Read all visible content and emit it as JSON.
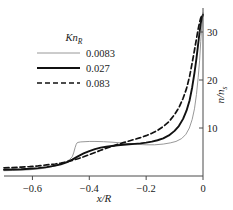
{
  "chart_data": {
    "type": "line",
    "title": "",
    "xlabel": "x/R",
    "ylabel": "n/n_s",
    "ylabel_main": "n/n",
    "ylabel_sub": "s",
    "xlabel_main": "x/R",
    "xlim": [
      -0.7,
      0.0
    ],
    "ylim": [
      0,
      35
    ],
    "xticks": [
      -0.6,
      -0.4,
      -0.2,
      0
    ],
    "xticklabels": [
      "−0.6",
      "−0.4",
      "−0.2",
      "0"
    ],
    "yticks": [
      10,
      20,
      30
    ],
    "yticklabels": [
      "10",
      "20",
      "30"
    ],
    "grid": false,
    "legend_position": "upper-left",
    "legend_title": "Kn",
    "legend_title_sub": "R",
    "series": [
      {
        "name": "0.0083",
        "style": "thin-solid",
        "color": "#8c8c8c",
        "width": 0.9,
        "x": [
          -0.7,
          -0.67,
          -0.64,
          -0.61,
          -0.58,
          -0.55,
          -0.52,
          -0.5,
          -0.48,
          -0.47,
          -0.46,
          -0.455,
          -0.45,
          -0.446,
          -0.443,
          -0.44,
          -0.43,
          -0.415,
          -0.4,
          -0.38,
          -0.35,
          -0.32,
          -0.29,
          -0.26,
          -0.23,
          -0.2,
          -0.17,
          -0.14,
          -0.115,
          -0.095,
          -0.075,
          -0.06,
          -0.048,
          -0.038,
          -0.03,
          -0.023,
          -0.017,
          -0.012,
          -0.008,
          -0.004,
          0.0
        ],
        "y": [
          1.1,
          1.15,
          1.2,
          1.3,
          1.45,
          1.7,
          2.1,
          2.5,
          3.0,
          3.4,
          4.0,
          4.8,
          5.9,
          6.6,
          6.9,
          7.0,
          7.1,
          7.15,
          7.2,
          7.2,
          7.15,
          7.05,
          6.9,
          6.75,
          6.6,
          6.5,
          6.5,
          6.65,
          6.9,
          7.2,
          7.8,
          8.7,
          10.0,
          11.8,
          14.0,
          17.0,
          20.5,
          24.0,
          28.0,
          31.5,
          34.0
        ]
      },
      {
        "name": "0.027",
        "style": "thick-solid",
        "color": "#111111",
        "width": 1.9,
        "x": [
          -0.7,
          -0.67,
          -0.64,
          -0.61,
          -0.58,
          -0.55,
          -0.52,
          -0.5,
          -0.48,
          -0.46,
          -0.44,
          -0.42,
          -0.4,
          -0.38,
          -0.36,
          -0.34,
          -0.32,
          -0.3,
          -0.28,
          -0.26,
          -0.24,
          -0.22,
          -0.2,
          -0.18,
          -0.16,
          -0.14,
          -0.12,
          -0.1,
          -0.085,
          -0.07,
          -0.058,
          -0.047,
          -0.038,
          -0.03,
          -0.023,
          -0.017,
          -0.012,
          -0.008,
          -0.004,
          0.0
        ],
        "y": [
          1.3,
          1.35,
          1.4,
          1.5,
          1.65,
          1.85,
          2.15,
          2.45,
          2.85,
          3.4,
          4.1,
          4.7,
          5.2,
          5.6,
          5.9,
          6.1,
          6.25,
          6.4,
          6.5,
          6.6,
          6.7,
          6.8,
          6.95,
          7.15,
          7.45,
          7.85,
          8.45,
          9.4,
          10.4,
          11.9,
          13.6,
          15.8,
          18.5,
          21.5,
          24.5,
          27.5,
          30.0,
          31.8,
          33.0,
          33.6
        ]
      },
      {
        "name": "0.083",
        "style": "dashed",
        "color": "#111111",
        "width": 1.7,
        "x": [
          -0.7,
          -0.67,
          -0.64,
          -0.61,
          -0.58,
          -0.55,
          -0.52,
          -0.5,
          -0.48,
          -0.46,
          -0.44,
          -0.42,
          -0.4,
          -0.38,
          -0.36,
          -0.34,
          -0.32,
          -0.3,
          -0.28,
          -0.26,
          -0.24,
          -0.22,
          -0.2,
          -0.18,
          -0.16,
          -0.14,
          -0.12,
          -0.1,
          -0.085,
          -0.07,
          -0.058,
          -0.047,
          -0.038,
          -0.03,
          -0.023,
          -0.017,
          -0.012,
          -0.008,
          -0.004,
          0.0
        ],
        "y": [
          1.7,
          1.75,
          1.85,
          1.95,
          2.1,
          2.3,
          2.5,
          2.7,
          2.95,
          3.25,
          3.6,
          4.0,
          4.45,
          4.9,
          5.35,
          5.8,
          6.2,
          6.6,
          6.95,
          7.3,
          7.65,
          8.0,
          8.4,
          8.9,
          9.5,
          10.3,
          11.3,
          12.8,
          14.2,
          16.2,
          18.2,
          20.8,
          23.6,
          26.2,
          28.6,
          30.6,
          32.0,
          32.9,
          33.4,
          33.6
        ]
      }
    ]
  },
  "axes": {
    "left_spine": false,
    "bottom_spine": true,
    "right_spine": true,
    "top_spine": false
  }
}
